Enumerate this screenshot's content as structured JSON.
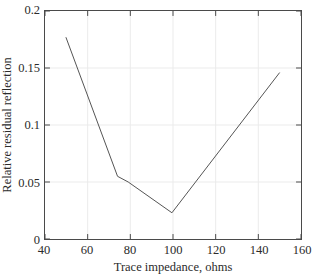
{
  "chart_data": {
    "type": "line",
    "title": "",
    "xlabel": "Trace impedance, ohms",
    "ylabel": "Relative residual reflection",
    "xlim": [
      40,
      160
    ],
    "ylim": [
      0,
      0.2
    ],
    "xticks": [
      40,
      60,
      80,
      100,
      120,
      140,
      160
    ],
    "xtick_labels": [
      "40",
      "60",
      "80",
      "100",
      "120",
      "140",
      "160"
    ],
    "yticks": [
      0,
      0.05,
      0.1,
      0.15,
      0.2
    ],
    "ytick_labels": [
      "0",
      "0.05",
      "0.1",
      "0.15",
      "0.2"
    ],
    "grid": true,
    "grid_color": "#ebebeb",
    "legend": null,
    "line_color": "#555555",
    "line_width": 1,
    "series": [
      {
        "name": "Relative residual reflection",
        "x": [
          49.8,
          74.0,
          79.0,
          99.5,
          150.0
        ],
        "y": [
          0.177,
          0.055,
          0.05,
          0.023,
          0.146
        ]
      }
    ]
  },
  "axes": {
    "frame_color": "#4a4a4a",
    "background": "#ffffff"
  }
}
